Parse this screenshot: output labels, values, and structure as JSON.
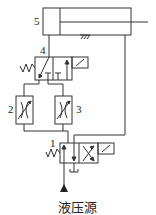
{
  "diagram": {
    "type": "hydraulic-circuit",
    "components": [
      {
        "id": "1",
        "label": "1",
        "kind": "two-position solenoid directional valve (crossed / parallel)"
      },
      {
        "id": "2",
        "label": "2",
        "kind": "adjustable throttle valve"
      },
      {
        "id": "3",
        "label": "3",
        "kind": "adjustable throttle valve"
      },
      {
        "id": "4",
        "label": "4",
        "kind": "two-position solenoid directional valve with spring return"
      },
      {
        "id": "5",
        "label": "5",
        "kind": "single-rod hydraulic cylinder"
      }
    ],
    "source_label": "液压源"
  },
  "colors": {
    "line": "#333333",
    "background": "#ffffff"
  }
}
